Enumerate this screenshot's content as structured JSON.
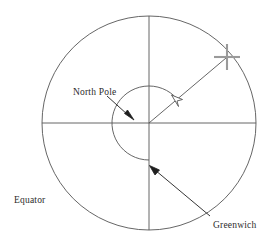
{
  "figure": {
    "type": "geometry-diagram",
    "background_color": "#ffffff",
    "stroke_color": "#555555",
    "text_color": "#2b2b2b",
    "marker_color": "#999999",
    "width": 279,
    "height": 244
  },
  "labels": {
    "north_pole": "North Pole",
    "equator": "Equator",
    "greenwich": "Greenwich"
  },
  "geometry": {
    "circle": {
      "name": "equator-circle",
      "center_x": 149,
      "center_y": 123,
      "radius": 107
    },
    "horizontal_axis": {
      "name": "horizontal-diameter",
      "x1": 42,
      "y1": 123,
      "x2": 256,
      "y2": 123
    },
    "vertical_axis": {
      "name": "vertical-diameter-greenwich-meridian",
      "x1": 149,
      "y1": 16,
      "x2": 149,
      "y2": 230
    },
    "radius_line": {
      "name": "meridian-radius",
      "x1": 149,
      "y1": 123,
      "x2": 227,
      "y2": 57,
      "angle_degrees": 40
    },
    "cross_marker": {
      "name": "location-cross-marker",
      "cx": 227,
      "cy": 57,
      "arm": 13
    },
    "longitude_arc": {
      "name": "longitude-angle-arc",
      "center_x": 149,
      "center_y": 123,
      "radius": 37,
      "start_angle_degrees": 40,
      "end_angle_degrees": 270,
      "sweep": "clockwise"
    }
  },
  "annotations": {
    "north_pole_arrow": {
      "name": "north-pole-arrow",
      "from_x": 108,
      "from_y": 97,
      "to_x": 133,
      "to_y": 119,
      "head": "solid"
    },
    "greenwich_arrow": {
      "name": "greenwich-arrow",
      "from_x": 208,
      "from_y": 215,
      "to_x": 152,
      "to_y": 168,
      "head": "solid"
    },
    "arc_arrow": {
      "name": "arc-direction-arrowhead",
      "x": 176,
      "y": 105,
      "head": "hollow"
    }
  }
}
